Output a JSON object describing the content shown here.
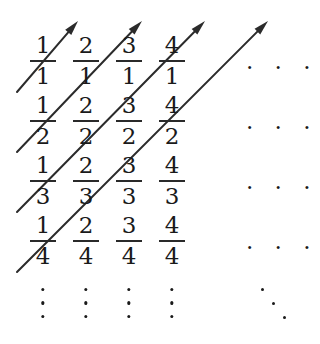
{
  "figure": {
    "background_color": "#ffffff",
    "ink_color": "#1a1a1a"
  },
  "grid": {
    "column_count": 4,
    "row_count": 4,
    "column_centers_px": [
      43,
      86,
      129,
      172
    ],
    "row_centers_px": [
      62,
      122,
      182,
      242
    ],
    "cells": [
      [
        {
          "numerator": "1",
          "denominator": "1"
        },
        {
          "numerator": "2",
          "denominator": "1"
        },
        {
          "numerator": "3",
          "denominator": "1"
        },
        {
          "numerator": "4",
          "denominator": "1"
        }
      ],
      [
        {
          "numerator": "1",
          "denominator": "2"
        },
        {
          "numerator": "2",
          "denominator": "2"
        },
        {
          "numerator": "3",
          "denominator": "2"
        },
        {
          "numerator": "4",
          "denominator": "2"
        }
      ],
      [
        {
          "numerator": "1",
          "denominator": "3"
        },
        {
          "numerator": "2",
          "denominator": "3"
        },
        {
          "numerator": "3",
          "denominator": "3"
        },
        {
          "numerator": "4",
          "denominator": "3"
        }
      ],
      [
        {
          "numerator": "1",
          "denominator": "4"
        },
        {
          "numerator": "2",
          "denominator": "4"
        },
        {
          "numerator": "3",
          "denominator": "4"
        },
        {
          "numerator": "4",
          "denominator": "4"
        }
      ]
    ]
  },
  "row_ellipses": [
    {
      "label": ". . .",
      "x": 246,
      "y": 62
    },
    {
      "label": ". . .",
      "x": 246,
      "y": 122
    },
    {
      "label": ". . .",
      "x": 246,
      "y": 182
    },
    {
      "label": ". . .",
      "x": 246,
      "y": 242
    }
  ],
  "column_ellipses": [
    {
      "label": "vertical-ellipsis",
      "x": 43,
      "y": 288
    },
    {
      "label": "vertical-ellipsis",
      "x": 86,
      "y": 288
    },
    {
      "label": "vertical-ellipsis",
      "x": 129,
      "y": 288
    },
    {
      "label": "vertical-ellipsis",
      "x": 172,
      "y": 288
    }
  ],
  "diagonal_ellipsis": {
    "label": "diagonal-ellipsis",
    "dots": [
      [
        261,
        288
      ],
      [
        272,
        302
      ],
      [
        283,
        316
      ]
    ]
  },
  "arrows": [
    {
      "name": "diagonal-arrow-1",
      "x1": 17,
      "y1": 92,
      "x2": 78,
      "y2": 21
    },
    {
      "name": "diagonal-arrow-2",
      "x1": 17,
      "y1": 152,
      "x2": 142,
      "y2": 21
    },
    {
      "name": "diagonal-arrow-3",
      "x1": 17,
      "y1": 212,
      "x2": 205,
      "y2": 21
    },
    {
      "name": "diagonal-arrow-4",
      "x1": 17,
      "y1": 272,
      "x2": 268,
      "y2": 21
    }
  ],
  "arrow_style": {
    "stroke_color": "#2b2b2b",
    "stroke_width": 2,
    "head_length": 15,
    "head_width": 8
  }
}
